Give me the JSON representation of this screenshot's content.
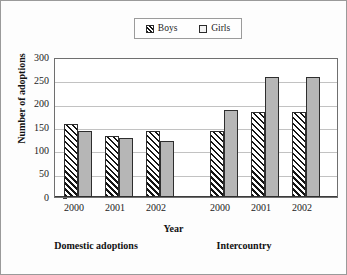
{
  "chart_data": {
    "type": "bar",
    "title": "",
    "xlabel": "Year",
    "ylabel": "Number of adoptions",
    "ylim": [
      0,
      300
    ],
    "ytick_values": [
      0,
      50,
      100,
      150,
      200,
      250,
      300
    ],
    "ytick_labels": [
      "0",
      "50",
      "100",
      "150",
      "200",
      "250",
      "300"
    ],
    "grid": true,
    "legend_position": "top-center",
    "categories": [
      "2000",
      "2001",
      "2002",
      "2000",
      "2001",
      "2002"
    ],
    "groups": [
      {
        "label": "Domestic adoptions",
        "categories": [
          "2000",
          "2001",
          "2002"
        ]
      },
      {
        "label": "Intercountry",
        "categories": [
          "2000",
          "2001",
          "2002"
        ]
      }
    ],
    "series": [
      {
        "name": "Boys",
        "values": [
          157,
          131,
          143,
          143,
          184,
          183
        ],
        "fill": "hatch",
        "color": "#ffffff"
      },
      {
        "name": "Girls",
        "values": [
          142,
          127,
          120,
          188,
          258,
          260
        ],
        "fill": "solidgray",
        "color": "#b6b6b6"
      }
    ],
    "bars": [
      {
        "group": "Domestic adoptions",
        "year": "2000",
        "series": "Boys",
        "value": 157,
        "x": 9,
        "fill": "hatch"
      },
      {
        "group": "Domestic adoptions",
        "year": "2000",
        "series": "Girls",
        "value": 142,
        "x": 23,
        "fill": "solidgray"
      },
      {
        "group": "Domestic adoptions",
        "year": "2001",
        "series": "Boys",
        "value": 131,
        "x": 50,
        "fill": "hatch"
      },
      {
        "group": "Domestic adoptions",
        "year": "2001",
        "series": "Girls",
        "value": 127,
        "x": 64,
        "fill": "solidgray"
      },
      {
        "group": "Domestic adoptions",
        "year": "2002",
        "series": "Boys",
        "value": 143,
        "x": 91,
        "fill": "hatch"
      },
      {
        "group": "Domestic adoptions",
        "year": "2002",
        "series": "Girls",
        "value": 120,
        "x": 105,
        "fill": "solidgray"
      },
      {
        "group": "Intercountry",
        "year": "2000",
        "series": "Boys",
        "value": 143,
        "x": 155,
        "fill": "hatch"
      },
      {
        "group": "Intercountry",
        "year": "2000",
        "series": "Girls",
        "value": 188,
        "x": 169,
        "fill": "solidgray"
      },
      {
        "group": "Intercountry",
        "year": "2001",
        "series": "Boys",
        "value": 184,
        "x": 196,
        "fill": "hatch"
      },
      {
        "group": "Intercountry",
        "year": "2001",
        "series": "Girls",
        "value": 258,
        "x": 210,
        "fill": "solidgray"
      },
      {
        "group": "Intercountry",
        "year": "2002",
        "series": "Boys",
        "value": 183,
        "x": 237,
        "fill": "hatch"
      },
      {
        "group": "Intercountry",
        "year": "2002",
        "series": "Girls",
        "value": 260,
        "x": 251,
        "fill": "solidgray"
      }
    ]
  },
  "legend": {
    "entries": [
      {
        "label": "Boys",
        "fill": "hatch"
      },
      {
        "label": "Girls",
        "fill": "solidgray"
      }
    ]
  },
  "axes": {
    "y_title": "Number of adoptions",
    "x_title": "Year",
    "y_ticks": [
      "300",
      "250",
      "200",
      "150",
      "100",
      "50",
      "0"
    ],
    "x_ticks": [
      "2000",
      "2001",
      "2002",
      "2000",
      "2001",
      "2002"
    ]
  },
  "groups": [
    {
      "label": "Domestic adoptions"
    },
    {
      "label": "Intercountry"
    }
  ],
  "colors": {
    "girls_fill": "#b6b6b6",
    "boys_fill": "#ffffff",
    "hatch_line": "#151515",
    "bar_border": "#2e2e2e",
    "gridline": "#c2c2c2",
    "axis": "#3c3c3c",
    "text": "#111111",
    "frame": "#9a9a9a"
  }
}
